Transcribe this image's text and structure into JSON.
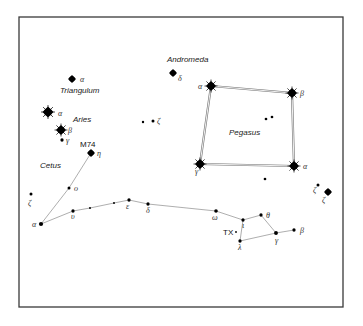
{
  "chart_data": {
    "type": "diagram",
    "title": "",
    "frame": {
      "x": 19,
      "y": 17,
      "width": 324,
      "height": 290
    },
    "constellations": [
      {
        "name": "Andromeda",
        "label_pos": [
          167,
          62
        ]
      },
      {
        "name": "Triangulum",
        "label_pos": [
          60,
          93
        ]
      },
      {
        "name": "Aries",
        "label_pos": [
          73,
          122
        ]
      },
      {
        "name": "Cetus",
        "label_pos": [
          40,
          168
        ]
      },
      {
        "name": "Pegasus",
        "label_pos": [
          229,
          135
        ]
      }
    ],
    "objects": [
      {
        "name": "M74",
        "pos": [
          80,
          147
        ]
      },
      {
        "name": "TX",
        "pos": [
          223,
          235
        ]
      }
    ],
    "stars": [
      {
        "id": "tri-alpha",
        "label": "α",
        "x": 72,
        "y": 79,
        "size": 4,
        "lx": 80,
        "ly": 82
      },
      {
        "id": "and-delta",
        "label": "δ",
        "x": 173,
        "y": 73,
        "size": 4,
        "lx": 178,
        "ly": 81
      },
      {
        "id": "ari-alpha",
        "label": "α",
        "x": 48,
        "y": 112,
        "size": 5.5,
        "lx": 58,
        "ly": 116
      },
      {
        "id": "ari-beta",
        "label": "β",
        "x": 61,
        "y": 130,
        "size": 5,
        "lx": 68,
        "ly": 133
      },
      {
        "id": "ari-gamma",
        "label": "γ",
        "x": 62,
        "y": 140,
        "size": 2.2,
        "lx": 66,
        "ly": 143
      },
      {
        "id": "cet-eta",
        "label": "η",
        "x": 91,
        "y": 153,
        "size": 4,
        "lx": 97,
        "ly": 156
      },
      {
        "id": "psc-a",
        "label": "",
        "x": 143,
        "y": 122,
        "size": 1.6,
        "lx": 0,
        "ly": 0
      },
      {
        "id": "psc-zeta",
        "label": "ζ",
        "x": 153,
        "y": 121,
        "size": 2,
        "lx": 157,
        "ly": 124
      },
      {
        "id": "peg-alpha",
        "label": "α",
        "x": 211,
        "y": 86,
        "size": 5,
        "lx": 198,
        "ly": 89
      },
      {
        "id": "peg-beta",
        "label": "β",
        "x": 292,
        "y": 93,
        "size": 5,
        "lx": 300,
        "ly": 96
      },
      {
        "id": "peg-gamma",
        "label": "γ",
        "x": 200,
        "y": 164,
        "size": 5,
        "lx": 195,
        "ly": 174
      },
      {
        "id": "peg-alpha2",
        "label": "α",
        "x": 294,
        "y": 166,
        "size": 5,
        "lx": 303,
        "ly": 169
      },
      {
        "id": "peg-in1",
        "label": "",
        "x": 266,
        "y": 119,
        "size": 1.8,
        "lx": 0,
        "ly": 0
      },
      {
        "id": "peg-in2",
        "label": "",
        "x": 272,
        "y": 117,
        "size": 1.8,
        "lx": 0,
        "ly": 0
      },
      {
        "id": "peg-below",
        "label": "",
        "x": 265,
        "y": 179,
        "size": 1.8,
        "lx": 0,
        "ly": 0
      },
      {
        "id": "psc-zeta-a",
        "label": "ζ",
        "x": 318,
        "y": 185,
        "size": 2,
        "lx": 313,
        "ly": 193
      },
      {
        "id": "psc-zeta-b",
        "label": "ζ",
        "x": 328,
        "y": 192,
        "size": 4,
        "lx": 322,
        "ly": 203
      },
      {
        "id": "cet-zeta",
        "label": "ζ",
        "x": 31,
        "y": 194,
        "size": 2,
        "lx": 28,
        "ly": 206
      },
      {
        "id": "cet-omicron",
        "label": "ο",
        "x": 69,
        "y": 188,
        "size": 2,
        "lx": 74,
        "ly": 191
      },
      {
        "id": "cet-alpha",
        "label": "α",
        "x": 41,
        "y": 224,
        "size": 2.8,
        "lx": 32,
        "ly": 227
      },
      {
        "id": "cet-upsilon",
        "label": "υ",
        "x": 73,
        "y": 211,
        "size": 2.2,
        "lx": 71,
        "ly": 219
      },
      {
        "id": "cet-a",
        "label": "",
        "x": 90,
        "y": 208,
        "size": 1.3,
        "lx": 0,
        "ly": 0
      },
      {
        "id": "cet-b",
        "label": "",
        "x": 114,
        "y": 203,
        "size": 1.3,
        "lx": 0,
        "ly": 0
      },
      {
        "id": "cet-epsilon",
        "label": "ε",
        "x": 129,
        "y": 200,
        "size": 2.2,
        "lx": 126,
        "ly": 209
      },
      {
        "id": "cet-delta",
        "label": "δ",
        "x": 148,
        "y": 204,
        "size": 2.2,
        "lx": 146,
        "ly": 213
      },
      {
        "id": "psc-omega",
        "label": "ω",
        "x": 216,
        "y": 211,
        "size": 2.4,
        "lx": 212,
        "ly": 220
      },
      {
        "id": "psc-iota",
        "label": "ι",
        "x": 243,
        "y": 220,
        "size": 2.2,
        "lx": 242,
        "ly": 228
      },
      {
        "id": "psc-theta",
        "label": "θ",
        "x": 261,
        "y": 215,
        "size": 2.2,
        "lx": 266,
        "ly": 218
      },
      {
        "id": "psc-gamma",
        "label": "γ",
        "x": 276,
        "y": 233,
        "size": 2.6,
        "lx": 275,
        "ly": 243
      },
      {
        "id": "psc-beta",
        "label": "β",
        "x": 294,
        "y": 230,
        "size": 2.2,
        "lx": 300,
        "ly": 233
      },
      {
        "id": "psc-lambda",
        "label": "λ",
        "x": 240,
        "y": 241,
        "size": 2.2,
        "lx": 238,
        "ly": 250
      }
    ],
    "lines": [
      {
        "from": "cet-alpha",
        "to": "cet-omicron"
      },
      {
        "from": "cet-omicron",
        "to": "cet-eta"
      },
      {
        "from": "cet-alpha",
        "to": "cet-upsilon"
      },
      {
        "from": "cet-upsilon",
        "to": "cet-a"
      },
      {
        "from": "cet-a",
        "to": "cet-b"
      },
      {
        "from": "cet-b",
        "to": "cet-epsilon"
      },
      {
        "from": "cet-epsilon",
        "to": "cet-delta"
      },
      {
        "from": "cet-delta",
        "to": "psc-omega"
      },
      {
        "from": "psc-omega",
        "to": "psc-iota"
      },
      {
        "from": "psc-iota",
        "to": "psc-theta"
      },
      {
        "from": "psc-theta",
        "to": "psc-gamma"
      },
      {
        "from": "psc-gamma",
        "to": "psc-beta"
      },
      {
        "from": "psc-gamma",
        "to": "psc-lambda"
      },
      {
        "from": "psc-lambda",
        "to": "psc-iota"
      }
    ],
    "square": [
      "peg-alpha",
      "peg-beta",
      "peg-alpha2",
      "peg-gamma"
    ]
  }
}
